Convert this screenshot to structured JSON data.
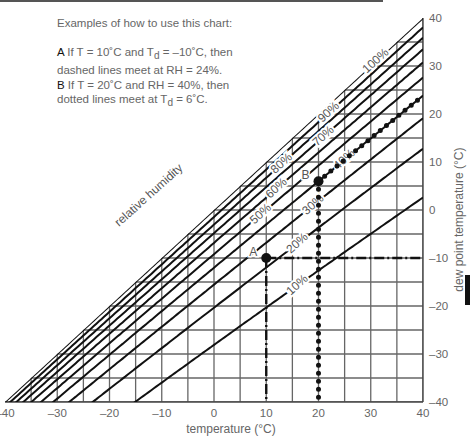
{
  "header_bar": true,
  "notes": {
    "title": "Examples of how to use this chart:",
    "example_a_label": "A",
    "example_a_text_1": " If T = 10˚C and T",
    "example_a_sub": "d",
    "example_a_text_2": " = –10˚C, then",
    "example_a_line2": "dashed lines meet at RH = 24%.",
    "example_b_label": "B",
    "example_b_text": " If T = 20˚C and RH = 40%, then",
    "example_b_line2_pre": "dotted lines meet at T",
    "example_b_sub": "d",
    "example_b_line2_post": " = 6˚C."
  },
  "chart_data": {
    "type": "line",
    "title": "",
    "xlabel": "temperature (°C)",
    "ylabel": "dew point temperature (°C)",
    "xlim": [
      -40,
      40
    ],
    "ylim": [
      -40,
      40
    ],
    "grid": true,
    "grid_step": 5,
    "x_ticks": [
      -40,
      -30,
      -20,
      -10,
      0,
      10,
      20,
      30,
      40
    ],
    "x_tick_labels": [
      "–40",
      "–30",
      "–20",
      "–10",
      "0",
      "10",
      "20",
      "30",
      "40"
    ],
    "y_ticks": [
      40,
      30,
      20,
      10,
      0,
      -10,
      -20,
      -30,
      -40
    ],
    "y_tick_labels": [
      "40",
      "30",
      "20",
      "10",
      "0",
      "–10",
      "–20",
      "–30",
      "–40"
    ],
    "curve_label": "relative humidity",
    "series": [
      {
        "name": "100%",
        "rh": 100
      },
      {
        "name": "90%",
        "rh": 90
      },
      {
        "name": "80%",
        "rh": 80
      },
      {
        "name": "70%",
        "rh": 70
      },
      {
        "name": "60%",
        "rh": 60
      },
      {
        "name": "50%",
        "rh": 50
      },
      {
        "name": "40%",
        "rh": 40
      },
      {
        "name": "30%",
        "rh": 30
      },
      {
        "name": "20%",
        "rh": 20
      },
      {
        "name": "10%",
        "rh": 10
      }
    ],
    "annotations": [
      {
        "label": "A",
        "T": 10,
        "Td": -10,
        "style": "dash-dot",
        "rh_result": 24
      },
      {
        "label": "B",
        "T": 20,
        "Td": 6,
        "style": "dotted",
        "rh": 40
      }
    ]
  }
}
